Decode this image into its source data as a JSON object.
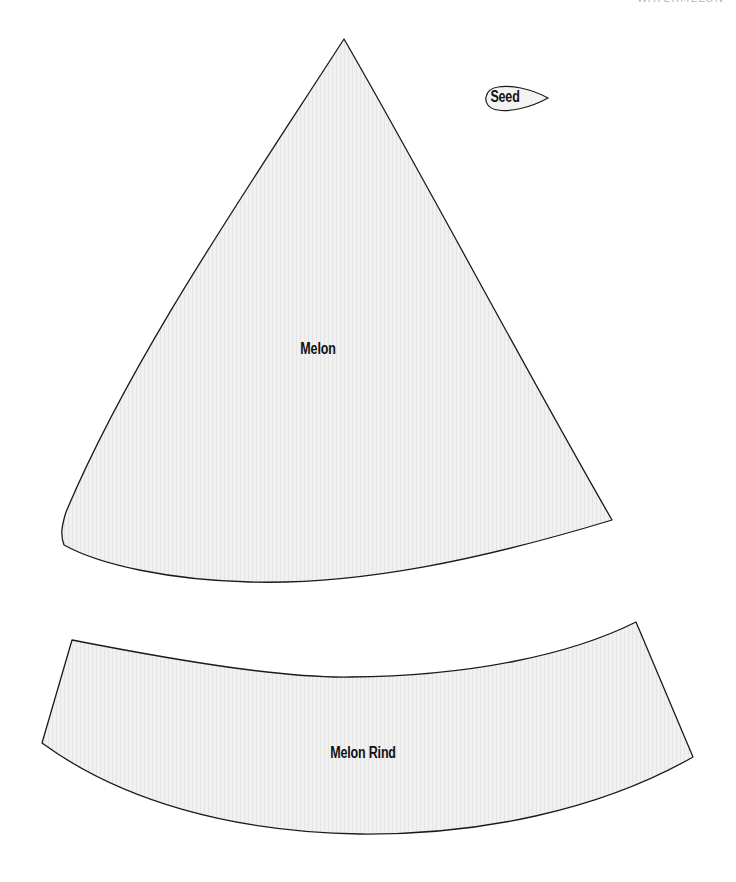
{
  "header": {
    "text": "WATERMELON"
  },
  "pieces": {
    "melon": {
      "label": "Melon"
    },
    "rind": {
      "label": "Melon Rind"
    },
    "seed": {
      "label": "Seed"
    }
  },
  "style": {
    "fill_color": "#f0f0f0",
    "stroke_color": "#1a1a1a",
    "stripe_color": "#e4e4e4"
  }
}
